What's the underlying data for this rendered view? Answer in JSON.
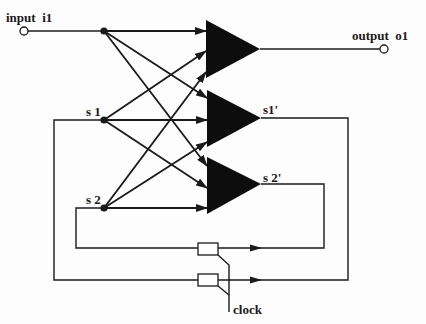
{
  "diagram": {
    "type": "recurrent-network-schematic",
    "colors": {
      "ink": "#1a1a1a",
      "background": "#fdfdfd"
    },
    "labels": {
      "input": "input  i1",
      "output": "output  o1",
      "s1": "s 1",
      "s2": "s 2",
      "s1_prime": "s1'",
      "s2_prime": "s 2'",
      "clock": "clock"
    },
    "nodes": [
      {
        "id": "i1",
        "kind": "input-terminal",
        "x": 24,
        "y": 31
      },
      {
        "id": "j_i1",
        "kind": "junction",
        "x": 104,
        "y": 31
      },
      {
        "id": "j_s1",
        "kind": "junction",
        "x": 104,
        "y": 120
      },
      {
        "id": "j_s2",
        "kind": "junction",
        "x": 104,
        "y": 208
      },
      {
        "id": "o1",
        "kind": "output-terminal",
        "x": 384,
        "y": 49
      }
    ],
    "units": [
      {
        "id": "amp-o1",
        "output": "o1"
      },
      {
        "id": "amp-s1prime",
        "output": "s1'"
      },
      {
        "id": "amp-s2prime",
        "output": "s2'"
      }
    ],
    "delays": [
      {
        "id": "delay-s2",
        "from": "s2'",
        "to": "s2"
      },
      {
        "id": "delay-s1",
        "from": "s1'",
        "to": "s1"
      }
    ]
  }
}
